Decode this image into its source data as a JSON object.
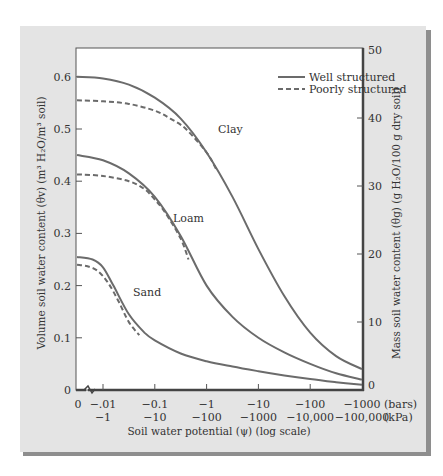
{
  "chart_data": {
    "type": "line",
    "title": "",
    "xlabel": "Soil water potential (ψ) (log scale)",
    "ylabel_left": "Volume soil water content (θv) (m³ H₂O/m³ soil)",
    "ylabel_right": "Mass soil water content (θg) (g H₂O/100 g dry soil)",
    "x_scale": "log",
    "x_units_row1": "(bars)",
    "x_units_row2": "(kPa)",
    "x_ticks_bars": [
      "0",
      "−.01",
      "−0.1",
      "−1",
      "−10",
      "−100",
      "−1000"
    ],
    "x_ticks_kpa": [
      "",
      "−1",
      "−10",
      "−100",
      "−1000",
      "−10,000",
      "−100,000"
    ],
    "x_tick_exponents": [
      null,
      -2,
      -1,
      0,
      1,
      2,
      3
    ],
    "y_left_ticks": [
      "0",
      "0.1",
      "0.2",
      "0.3",
      "0.4",
      "0.5",
      "0.6"
    ],
    "y_left_range": [
      0,
      0.65
    ],
    "y_right_ticks": [
      "0",
      "10",
      "20",
      "30",
      "40",
      "50"
    ],
    "y_right_range": [
      0,
      50
    ],
    "grid": false,
    "legend": {
      "position": "top-right",
      "entries": [
        {
          "label": "Well structured",
          "style": "solid"
        },
        {
          "label": "Poorly structured",
          "style": "dashed"
        }
      ]
    },
    "annotations": [
      {
        "text": "Clay",
        "x_bars": -1.2,
        "y": 0.435
      },
      {
        "text": "Loam",
        "x_bars": -0.19,
        "y": 0.3
      },
      {
        "text": "Sand",
        "x_bars": -0.055,
        "y": 0.145
      }
    ],
    "series": [
      {
        "name": "Clay — Well structured",
        "style": "solid",
        "log10_abs_bars": [
          -2.55,
          -2,
          -1.5,
          -1,
          -0.5,
          0,
          0.5,
          1,
          1.5,
          2,
          2.5,
          3
        ],
        "values": [
          0.6,
          0.597,
          0.585,
          0.56,
          0.52,
          0.455,
          0.37,
          0.27,
          0.18,
          0.11,
          0.065,
          0.04
        ]
      },
      {
        "name": "Clay — Poorly structured",
        "style": "dashed",
        "log10_abs_bars": [
          -2.55,
          -2,
          -1.5,
          -1,
          -0.7,
          -0.4,
          0,
          0.2
        ],
        "values": [
          0.555,
          0.553,
          0.548,
          0.535,
          0.52,
          0.5,
          0.455,
          0.42
        ]
      },
      {
        "name": "Loam — Well structured",
        "style": "solid",
        "log10_abs_bars": [
          -2.55,
          -2,
          -1.5,
          -1,
          -0.5,
          0,
          0.5,
          1,
          1.5,
          2,
          2.5,
          3
        ],
        "values": [
          0.45,
          0.44,
          0.415,
          0.37,
          0.295,
          0.2,
          0.14,
          0.1,
          0.072,
          0.05,
          0.032,
          0.02
        ]
      },
      {
        "name": "Loam — Poorly structured",
        "style": "dashed",
        "log10_abs_bars": [
          -2.55,
          -2,
          -1.5,
          -1.2,
          -1,
          -0.8,
          -0.5,
          -0.35
        ],
        "values": [
          0.413,
          0.41,
          0.4,
          0.385,
          0.365,
          0.34,
          0.29,
          0.25
        ]
      },
      {
        "name": "Sand — Well structured",
        "style": "solid",
        "log10_abs_bars": [
          -2.55,
          -2.2,
          -2,
          -1.8,
          -1.5,
          -1.2,
          -1,
          -0.5,
          0,
          0.5,
          1,
          1.5,
          2,
          2.5,
          3
        ],
        "values": [
          0.255,
          0.25,
          0.235,
          0.2,
          0.145,
          0.11,
          0.095,
          0.07,
          0.055,
          0.045,
          0.036,
          0.028,
          0.021,
          0.015,
          0.01
        ]
      },
      {
        "name": "Sand — Poorly structured",
        "style": "dashed",
        "log10_abs_bars": [
          -2.55,
          -2.3,
          -2.1,
          -1.9,
          -1.7,
          -1.5,
          -1.3
        ],
        "values": [
          0.24,
          0.237,
          0.228,
          0.205,
          0.17,
          0.13,
          0.105
        ]
      }
    ],
    "colors": {
      "line": "#6b6b6b",
      "panel_bg": "#e4e4e4",
      "panel_shadow": "#8e8e8e",
      "plot_bg": "#ffffff",
      "frame": "#555555"
    }
  }
}
